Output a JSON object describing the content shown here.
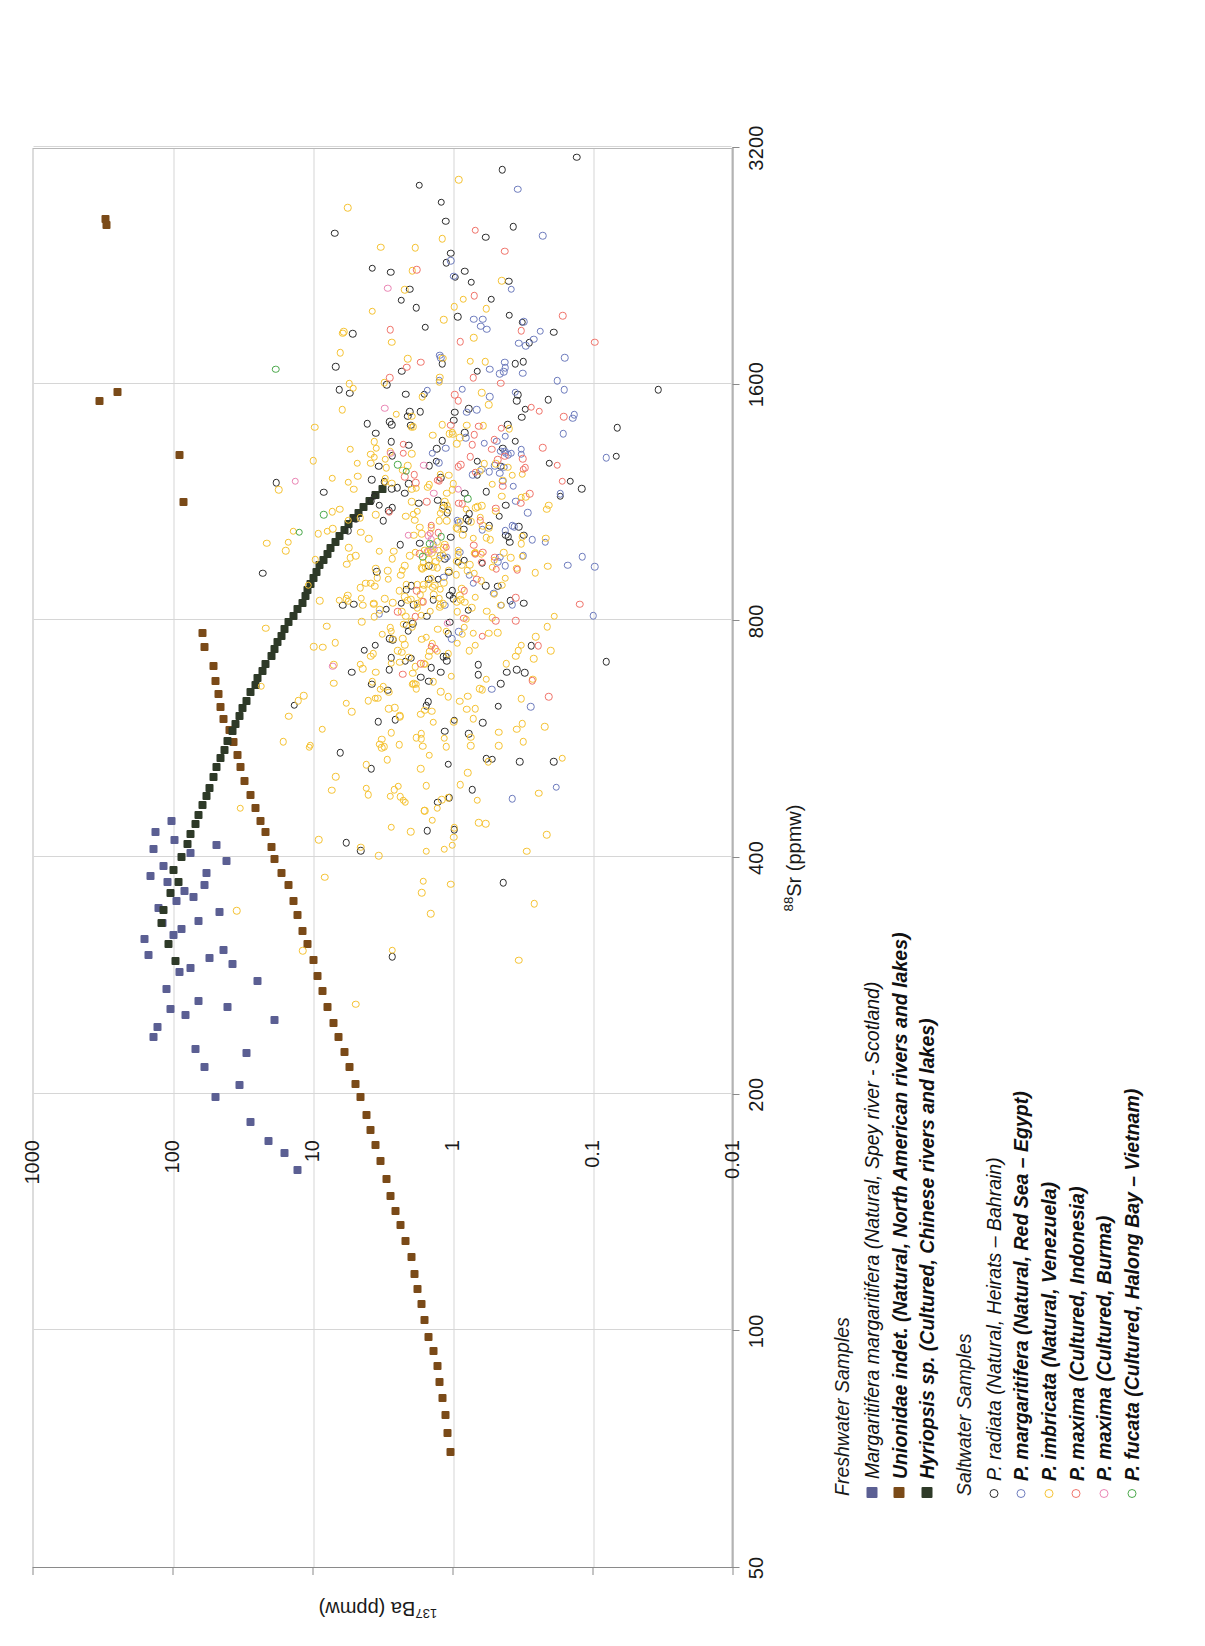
{
  "figure": {
    "orientation": "rotated-90-ccw",
    "background": "#ffffff"
  },
  "chart_data": {
    "type": "scatter",
    "title": "",
    "xlabel": "88Sr (ppmw)",
    "xlabel_isotope": "88",
    "xlabel_rest": "Sr (ppmw)",
    "ylabel": "137Ba (ppmw)",
    "ylabel_isotope": "137",
    "ylabel_rest": "Ba (ppmw)",
    "xscale": "log",
    "yscale": "log",
    "xlim": [
      50,
      3200
    ],
    "ylim": [
      0.01,
      1000
    ],
    "xticks": [
      "50",
      "100",
      "200",
      "400",
      "800",
      "1600",
      "3200"
    ],
    "xtick_values": [
      50,
      100,
      200,
      400,
      800,
      1600,
      3200
    ],
    "yticks": [
      "1000",
      "100",
      "10",
      "1",
      "0.1",
      "0.01"
    ],
    "ytick_values": [
      1000,
      100,
      10,
      1,
      0.1,
      0.01
    ],
    "grid": true,
    "grid_color": "#d6d6d6",
    "legend_position": "below-plot",
    "series": [
      {
        "name": "Margaritifera margaritifera (Natural, Spey river - Scotland)",
        "group": "Freshwater Samples",
        "marker": "filled-square",
        "color": "#5b5f93",
        "n": 46,
        "points": [
          [
            330,
            120
          ],
          [
            352,
            95
          ],
          [
            300,
            150
          ],
          [
            372,
            110
          ],
          [
            236,
            140
          ],
          [
            243,
            130
          ],
          [
            315,
            160
          ],
          [
            390,
            118
          ],
          [
            356,
            72
          ],
          [
            332,
            66
          ],
          [
            324,
            88
          ],
          [
            368,
            60
          ],
          [
            298,
            55
          ],
          [
            410,
            140
          ],
          [
            420,
            98
          ],
          [
            256,
            105
          ],
          [
            272,
            112
          ],
          [
            286,
            90
          ],
          [
            345,
            128
          ],
          [
            362,
            84
          ],
          [
            405,
            75
          ],
          [
            318,
            100
          ],
          [
            289,
            76
          ],
          [
            252,
            82
          ],
          [
            430,
            135
          ],
          [
            445,
            103
          ],
          [
            378,
            145
          ],
          [
            262,
            66
          ],
          [
            305,
            44
          ],
          [
            292,
            38
          ],
          [
            340,
            47
          ],
          [
            395,
            42
          ],
          [
            228,
            70
          ],
          [
            216,
            60
          ],
          [
            198,
            50
          ],
          [
            184,
            28
          ],
          [
            174,
            21
          ],
          [
            168,
            16
          ],
          [
            160,
            13
          ],
          [
            205,
            34
          ],
          [
            278,
            25
          ],
          [
            248,
            19
          ],
          [
            225,
            30
          ],
          [
            258,
            41
          ],
          [
            382,
            58
          ],
          [
            414,
            49
          ]
        ]
      },
      {
        "name": "Unionidae indet. (Natural, North American rivers and lakes)",
        "group": "Freshwater Samples",
        "marker": "filled-square",
        "color": "#7a4a18",
        "n": 62,
        "points": [
          [
            2550,
            300
          ],
          [
            2590,
            305
          ],
          [
            1520,
            340
          ],
          [
            1560,
            250
          ],
          [
            1300,
            90
          ],
          [
            1130,
            85
          ],
          [
            770,
            62
          ],
          [
            740,
            60
          ],
          [
            700,
            52
          ],
          [
            670,
            50
          ],
          [
            645,
            48
          ],
          [
            620,
            46
          ],
          [
            600,
            44
          ],
          [
            580,
            40
          ],
          [
            560,
            37
          ],
          [
            540,
            35
          ],
          [
            520,
            33
          ],
          [
            500,
            31
          ],
          [
            480,
            28
          ],
          [
            462,
            26
          ],
          [
            445,
            24
          ],
          [
            430,
            22
          ],
          [
            412,
            20
          ],
          [
            398,
            19
          ],
          [
            382,
            17
          ],
          [
            368,
            15
          ],
          [
            352,
            14
          ],
          [
            338,
            13
          ],
          [
            322,
            12
          ],
          [
            310,
            11
          ],
          [
            296,
            10
          ],
          [
            282,
            9.4
          ],
          [
            270,
            8.6
          ],
          [
            258,
            7.9
          ],
          [
            246,
            7.2
          ],
          [
            236,
            6.6
          ],
          [
            226,
            6.0
          ],
          [
            216,
            5.5
          ],
          [
            206,
            5.0
          ],
          [
            198,
            4.6
          ],
          [
            188,
            4.2
          ],
          [
            180,
            3.9
          ],
          [
            172,
            3.6
          ],
          [
            164,
            3.3
          ],
          [
            156,
            3.0
          ],
          [
            148,
            2.8
          ],
          [
            142,
            2.6
          ],
          [
            136,
            2.4
          ],
          [
            130,
            2.2
          ],
          [
            124,
            2.0
          ],
          [
            118,
            1.9
          ],
          [
            113,
            1.8
          ],
          [
            108,
            1.7
          ],
          [
            103,
            1.6
          ],
          [
            98,
            1.5
          ],
          [
            94,
            1.4
          ],
          [
            90,
            1.3
          ],
          [
            86,
            1.25
          ],
          [
            82,
            1.2
          ],
          [
            78,
            1.15
          ],
          [
            74,
            1.1
          ],
          [
            70,
            1.05
          ]
        ]
      },
      {
        "name": "Hyriopsis sp. (Cultured, Chinese rivers and lakes)",
        "group": "Freshwater Samples",
        "marker": "filled-square",
        "color": "#2e3a28",
        "n": 58,
        "points": [
          [
            330,
            122
          ],
          [
            310,
            108
          ],
          [
            295,
            96
          ],
          [
            342,
            118
          ],
          [
            360,
            105
          ],
          [
            372,
            92
          ],
          [
            385,
            100
          ],
          [
            400,
            88
          ],
          [
            415,
            80
          ],
          [
            428,
            76
          ],
          [
            440,
            70
          ],
          [
            452,
            66
          ],
          [
            466,
            62
          ],
          [
            478,
            58
          ],
          [
            490,
            55
          ],
          [
            505,
            52
          ],
          [
            520,
            49
          ],
          [
            534,
            46
          ],
          [
            548,
            43
          ],
          [
            562,
            41
          ],
          [
            578,
            38
          ],
          [
            590,
            36
          ],
          [
            604,
            34
          ],
          [
            618,
            32
          ],
          [
            632,
            30
          ],
          [
            648,
            28
          ],
          [
            662,
            26
          ],
          [
            676,
            25
          ],
          [
            690,
            23
          ],
          [
            704,
            22
          ],
          [
            720,
            20
          ],
          [
            735,
            19
          ],
          [
            750,
            18
          ],
          [
            764,
            17
          ],
          [
            780,
            16
          ],
          [
            795,
            15
          ],
          [
            810,
            14
          ],
          [
            826,
            13
          ],
          [
            842,
            12
          ],
          [
            858,
            11.5
          ],
          [
            874,
            11
          ],
          [
            890,
            10.5
          ],
          [
            906,
            10
          ],
          [
            922,
            9.5
          ],
          [
            940,
            9
          ],
          [
            956,
            8.5
          ],
          [
            972,
            8
          ],
          [
            990,
            7.5
          ],
          [
            1006,
            7
          ],
          [
            1024,
            6.5
          ],
          [
            1042,
            6
          ],
          [
            1060,
            5.6
          ],
          [
            1078,
            5.2
          ],
          [
            1096,
            4.8
          ],
          [
            1116,
            4.4
          ],
          [
            1134,
            4.0
          ],
          [
            1154,
            3.6
          ],
          [
            1174,
            3.2
          ]
        ]
      },
      {
        "name": "P. radiata (Natural, Heirats – Bahrain)",
        "group": "Saltwater Samples",
        "marker": "open-circle",
        "color": "#2b2b2b",
        "n": 200,
        "cluster": {
          "cx": 1020,
          "cy": 1.15,
          "sx": 0.2,
          "sy": 0.42
        }
      },
      {
        "name": "P. margaritifera (Natural, Red Sea – Egypt)",
        "group": "Saltwater Samples",
        "marker": "open-circle",
        "color": "#6d7bbd",
        "n": 95,
        "cluster": {
          "cx": 1260,
          "cy": 0.52,
          "sx": 0.14,
          "sy": 0.32
        }
      },
      {
        "name": "P. imbricata (Natural, Venezuela)",
        "group": "Saltwater Samples",
        "marker": "open-circle",
        "color": "#f5c232",
        "n": 430,
        "cluster": {
          "cx": 880,
          "cy": 1.55,
          "sx": 0.175,
          "sy": 0.42
        }
      },
      {
        "name": "P. maxima (Cultured, Indonesia)",
        "group": "Saltwater Samples",
        "marker": "open-circle",
        "color": "#f0736a",
        "n": 85,
        "cluster": {
          "cx": 1230,
          "cy": 0.78,
          "sx": 0.145,
          "sy": 0.36
        }
      },
      {
        "name": "P. maxima (Cultured, Burma)",
        "group": "Saltwater Samples",
        "marker": "open-circle",
        "color": "#ea85b4",
        "n": 14,
        "cluster": {
          "cx": 1080,
          "cy": 2.3,
          "sx": 0.12,
          "sy": 0.3
        }
      },
      {
        "name": "P. fucata (Cultured, Halong Bay – Vietnam)",
        "group": "Saltwater Samples",
        "marker": "open-circle",
        "color": "#4aa84a",
        "n": 9,
        "cluster": {
          "cx": 1180,
          "cy": 2.9,
          "sx": 0.16,
          "sy": 0.52
        }
      }
    ]
  },
  "legend": {
    "groups": [
      {
        "title": "Freshwater Samples",
        "items": [
          {
            "label": "Margaritifera margaritifera (Natural, Spey river - Scotland)",
            "marker": "filled-square",
            "color": "#5b5f93",
            "bold": false
          },
          {
            "label": "Unionidae indet. (Natural, North American rivers and lakes)",
            "marker": "filled-square",
            "color": "#7a4a18",
            "bold": true
          },
          {
            "label": "Hyriopsis sp. (Cultured, Chinese rivers and lakes)",
            "marker": "filled-square",
            "color": "#2e3a28",
            "bold": true
          }
        ]
      },
      {
        "title": "Saltwater Samples",
        "items": [
          {
            "label": "P. radiata (Natural, Heirats – Bahrain)",
            "marker": "open-circle",
            "color": "#2b2b2b",
            "bold": false
          },
          {
            "label": "P. margaritifera (Natural, Red Sea – Egypt)",
            "marker": "open-circle",
            "color": "#6d7bbd",
            "bold": true
          },
          {
            "label": "P. imbricata (Natural, Venezuela)",
            "marker": "open-circle",
            "color": "#f5c232",
            "bold": true
          },
          {
            "label": "P. maxima (Cultured, Indonesia)",
            "marker": "open-circle",
            "color": "#f0736a",
            "bold": true
          },
          {
            "label": "P. maxima (Cultured, Burma)",
            "marker": "open-circle",
            "color": "#ea85b4",
            "bold": true
          },
          {
            "label": "P. fucata (Cultured, Halong Bay – Vietnam)",
            "marker": "open-circle",
            "color": "#4aa84a",
            "bold": true
          }
        ]
      }
    ]
  }
}
